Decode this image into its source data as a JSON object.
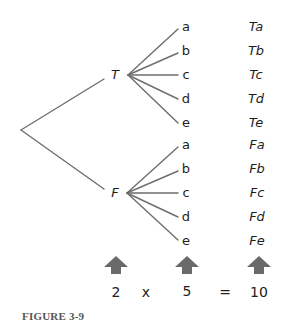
{
  "figure": {
    "caption": "FIGURE 3-9",
    "line_color": "#6e6e6e",
    "arrow_color": "#6a6a6a",
    "root_nodes": [
      {
        "label": "T",
        "leaves": [
          "a",
          "b",
          "c",
          "d",
          "e"
        ],
        "outcomes": [
          "Ta",
          "Tb",
          "Tc",
          "Td",
          "Te"
        ]
      },
      {
        "label": "F",
        "leaves": [
          "a",
          "b",
          "c",
          "d",
          "e"
        ],
        "outcomes": [
          "Fa",
          "Fb",
          "Fc",
          "Fd",
          "Fe"
        ]
      }
    ],
    "equation": {
      "left": "2",
      "times": "x",
      "middle": "5",
      "equals": "=",
      "result": "10"
    }
  }
}
